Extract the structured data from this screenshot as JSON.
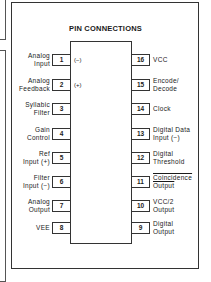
{
  "diagram": {
    "title": "PIN CONNECTIONS",
    "left_pins": [
      {
        "number": "1",
        "label": [
          "Analog",
          "Input"
        ],
        "inner": "(−)"
      },
      {
        "number": "2",
        "label": [
          "Analog",
          "Feedback"
        ],
        "inner": "(+)"
      },
      {
        "number": "3",
        "label": [
          "Syllabic",
          "Filter"
        ],
        "inner": ""
      },
      {
        "number": "4",
        "label": [
          "Gain",
          "Control"
        ],
        "inner": ""
      },
      {
        "number": "5",
        "label": [
          "Ref",
          "Input (+)"
        ],
        "inner": ""
      },
      {
        "number": "6",
        "label": [
          "Filter",
          "Input (−)"
        ],
        "inner": ""
      },
      {
        "number": "7",
        "label": [
          "Analog",
          "Output"
        ],
        "inner": ""
      },
      {
        "number": "8",
        "label": [
          "VEE",
          ""
        ],
        "inner": ""
      }
    ],
    "right_pins": [
      {
        "number": "16",
        "label": [
          "VCC",
          ""
        ]
      },
      {
        "number": "15",
        "label": [
          "Encode/",
          "Decode"
        ]
      },
      {
        "number": "14",
        "label": [
          "Clock",
          ""
        ]
      },
      {
        "number": "13",
        "label": [
          "Digital Data",
          "Input (−)"
        ]
      },
      {
        "number": "12",
        "label": [
          "Digital",
          "Threshold"
        ]
      },
      {
        "number": "11",
        "label": [
          "Coincidence",
          "Output"
        ]
      },
      {
        "number": "10",
        "label": [
          "VCC/2",
          "Output"
        ]
      },
      {
        "number": "9",
        "label": [
          "Digital",
          "Output"
        ]
      }
    ]
  }
}
